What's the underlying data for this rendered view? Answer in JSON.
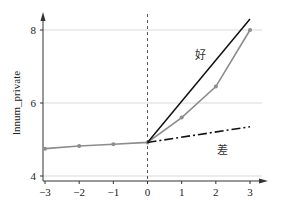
{
  "chart_data": {
    "type": "line",
    "title": "",
    "xlabel": "",
    "ylabel": "lnnum_private",
    "xlim": [
      -3,
      3
    ],
    "ylim": [
      4,
      8
    ],
    "x_ticks": [
      "−3",
      "−2",
      "−1",
      "0",
      "1",
      "2",
      "3"
    ],
    "y_ticks": [
      "4",
      "6",
      "8"
    ],
    "grid": "horizontal at y=4,6,8",
    "vertical_reference": {
      "x": 0,
      "style": "dashed"
    },
    "series": [
      {
        "name": "estimate",
        "style": "gray line with markers",
        "color": "#8c8c8c",
        "x": [
          -3,
          -2,
          -1,
          0,
          1,
          2,
          3
        ],
        "values": [
          4.75,
          4.82,
          4.87,
          4.92,
          5.6,
          6.45,
          8.0
        ]
      },
      {
        "name": "好",
        "style": "solid black",
        "color": "#111111",
        "x": [
          0,
          3
        ],
        "values": [
          4.92,
          8.3
        ]
      },
      {
        "name": "差",
        "style": "dash-dot black",
        "color": "#111111",
        "x": [
          0,
          3
        ],
        "values": [
          4.92,
          5.35
        ]
      }
    ],
    "annotations": [
      {
        "text": "好",
        "x": 1.55,
        "y": 7.2
      },
      {
        "text": "差",
        "x": 2.2,
        "y": 4.6
      }
    ]
  }
}
